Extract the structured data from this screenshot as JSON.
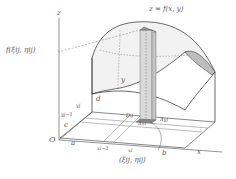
{
  "diagram": {
    "surface_label": "z = f(x, y)",
    "height_label": "f(ξij, ηij)",
    "sample_point_label": "(ξij, ηij)",
    "axes": {
      "z": "z",
      "x": "x",
      "y": "y",
      "origin": "O"
    },
    "x_ticks": [
      "a",
      "xi−1",
      "xi",
      "b"
    ],
    "y_ticks": [
      "c",
      "yj−1",
      "yj",
      "d"
    ],
    "cell_labels": {
      "region": "Dij",
      "dx": "Δxi",
      "dy": "Δyj"
    },
    "colors": {
      "line": "#555555",
      "surface_fill": "#f2f2f2",
      "column_fill": "#d9d9d9",
      "column_top": "#9a9a9a",
      "edge_fill": "#bdbdbd"
    }
  }
}
